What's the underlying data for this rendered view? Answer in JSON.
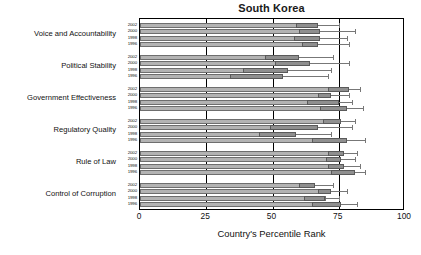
{
  "chart_data": {
    "type": "bar",
    "orientation": "horizontal",
    "title": "South Korea",
    "xlabel": "Country's Percentile Rank",
    "ylabel": "",
    "xlim": [
      0,
      100
    ],
    "xticks": [
      0,
      25,
      50,
      75,
      100
    ],
    "xticklabels": [
      "0",
      "25",
      "50",
      "75",
      "100"
    ],
    "grid": true,
    "gridlines_at": [
      25,
      50,
      75
    ],
    "legend": null,
    "years": [
      "2002",
      "2000",
      "1998",
      "1996"
    ],
    "categories": [
      "Voice and Accountability",
      "Political Stability",
      "Government Effectiveness",
      "Regulatory Quality",
      "Rule of Law",
      "Control of Corruption"
    ],
    "series": [
      {
        "name": "2002",
        "values": [
          67,
          60,
          79,
          76,
          77,
          66
        ]
      },
      {
        "name": "2000",
        "values": [
          68,
          64,
          72,
          67,
          76,
          72
        ]
      },
      {
        "name": "1998",
        "values": [
          68,
          56,
          75,
          59,
          77,
          70
        ]
      },
      {
        "name": "1996",
        "values": [
          67,
          54,
          78,
          78,
          81,
          76
        ]
      }
    ],
    "groups": [
      {
        "category": "Voice and Accountability",
        "bars": [
          {
            "year": "2002",
            "value": 67,
            "ci_low": 59,
            "ci_high": 75
          },
          {
            "year": "2000",
            "value": 68,
            "ci_low": 60,
            "ci_high": 81
          },
          {
            "year": "1998",
            "value": 68,
            "ci_low": 58,
            "ci_high": 78
          },
          {
            "year": "1996",
            "value": 67,
            "ci_low": 61,
            "ci_high": 79
          }
        ]
      },
      {
        "category": "Political Stability",
        "bars": [
          {
            "year": "2002",
            "value": 60,
            "ci_low": 47,
            "ci_high": 73
          },
          {
            "year": "2000",
            "value": 64,
            "ci_low": 51,
            "ci_high": 79
          },
          {
            "year": "1998",
            "value": 56,
            "ci_low": 39,
            "ci_high": 72
          },
          {
            "year": "1996",
            "value": 54,
            "ci_low": 34,
            "ci_high": 71
          }
        ]
      },
      {
        "category": "Government Effectiveness",
        "bars": [
          {
            "year": "2002",
            "value": 79,
            "ci_low": 71,
            "ci_high": 83
          },
          {
            "year": "2000",
            "value": 72,
            "ci_low": 67,
            "ci_high": 79
          },
          {
            "year": "1998",
            "value": 75,
            "ci_low": 63,
            "ci_high": 80
          },
          {
            "year": "1996",
            "value": 78,
            "ci_low": 68,
            "ci_high": 84
          }
        ]
      },
      {
        "category": "Regulatory Quality",
        "bars": [
          {
            "year": "2002",
            "value": 76,
            "ci_low": 69,
            "ci_high": 81
          },
          {
            "year": "2000",
            "value": 67,
            "ci_low": 49,
            "ci_high": 80
          },
          {
            "year": "1998",
            "value": 59,
            "ci_low": 45,
            "ci_high": 72
          },
          {
            "year": "1996",
            "value": 78,
            "ci_low": 65,
            "ci_high": 85
          }
        ]
      },
      {
        "category": "Rule of Law",
        "bars": [
          {
            "year": "2002",
            "value": 77,
            "ci_low": 71,
            "ci_high": 82
          },
          {
            "year": "2000",
            "value": 76,
            "ci_low": 70,
            "ci_high": 81
          },
          {
            "year": "1998",
            "value": 77,
            "ci_low": 71,
            "ci_high": 83
          },
          {
            "year": "1996",
            "value": 81,
            "ci_low": 72,
            "ci_high": 85
          }
        ]
      },
      {
        "category": "Control of Corruption",
        "bars": [
          {
            "year": "2002",
            "value": 66,
            "ci_low": 60,
            "ci_high": 73
          },
          {
            "year": "2000",
            "value": 72,
            "ci_low": 67,
            "ci_high": 78
          },
          {
            "year": "1998",
            "value": 70,
            "ci_low": 62,
            "ci_high": 75
          },
          {
            "year": "1996",
            "value": 76,
            "ci_low": 65,
            "ci_high": 82
          }
        ]
      }
    ],
    "colors": {
      "bar_fill": "#b3b3b3",
      "bar_tip_fill": "#8f8f8f",
      "bar_edge": "#6e6e6e",
      "whisker": "#777777",
      "axis": "#000000",
      "text": "#111111"
    }
  }
}
